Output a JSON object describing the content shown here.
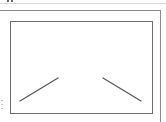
{
  "thumbnail": {
    "kind": "image-placeholder",
    "icon": "image-placeholder-icon",
    "colors": {
      "background": "#ffffff",
      "frame_border": "#6e6e6e",
      "outer_border": "#8a8a8a",
      "stroke": "#555555",
      "rule": "#d9d9d9"
    },
    "strokes": [
      {
        "name": "left-diagonal",
        "x1": 20,
        "y1": 101,
        "x2": 58,
        "y2": 78
      },
      {
        "name": "right-diagonal",
        "x1": 103,
        "y1": 78,
        "x2": 141,
        "y2": 101
      }
    ]
  }
}
